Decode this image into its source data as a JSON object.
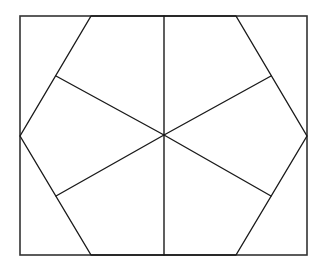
{
  "diagram": {
    "shapes": {
      "outer_frame": "rectangle",
      "inner_polygon": "hexagon",
      "spokes_count": 6,
      "kite_regions": 6,
      "corner_triangles": 4
    },
    "colors": {
      "line": "#1a1a1a",
      "frame": "#333333",
      "background": "#ffffff"
    }
  }
}
